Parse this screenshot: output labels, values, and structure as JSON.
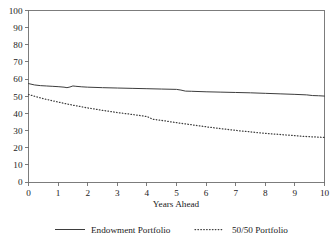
{
  "chart_data": {
    "type": "line",
    "title": "",
    "xlabel": "Years Ahead",
    "ylabel": "",
    "xlim": [
      0,
      10
    ],
    "ylim": [
      0,
      100
    ],
    "grid": false,
    "legend_position": "bottom",
    "xticks": [
      "0",
      "1",
      "2",
      "3",
      "4",
      "5",
      "6",
      "7",
      "8",
      "9",
      "10"
    ],
    "yticks": [
      "0",
      "10",
      "20",
      "30",
      "40",
      "50",
      "60",
      "70",
      "80",
      "90",
      "100"
    ],
    "series": [
      {
        "name": "Endowment Portfolio",
        "style": "solid",
        "color": "#3d3d3d",
        "x": [
          0.0,
          0.2,
          0.4,
          0.6,
          0.8,
          1.0,
          1.2,
          1.3,
          1.4,
          1.5,
          1.6,
          1.8,
          2.0,
          2.5,
          3.0,
          3.5,
          4.0,
          4.5,
          5.0,
          5.15,
          5.3,
          5.5,
          6.0,
          6.5,
          7.0,
          7.5,
          8.0,
          8.5,
          9.0,
          9.4,
          9.6,
          9.8,
          10.0
        ],
        "y": [
          57.4,
          56.6,
          56.2,
          56.0,
          55.8,
          55.6,
          55.3,
          55.0,
          55.4,
          56.0,
          55.8,
          55.5,
          55.3,
          55.0,
          54.8,
          54.6,
          54.4,
          54.2,
          54.0,
          53.6,
          53.0,
          52.9,
          52.6,
          52.4,
          52.2,
          52.0,
          51.7,
          51.4,
          51.1,
          50.8,
          50.4,
          50.3,
          50.1
        ]
      },
      {
        "name": "50/50 Portfolio",
        "style": "dotted",
        "color": "#3d3d3d",
        "x": [
          0.0,
          0.5,
          1.0,
          1.5,
          2.0,
          2.5,
          3.0,
          3.5,
          4.0,
          4.2,
          4.5,
          5.0,
          5.5,
          6.0,
          6.5,
          7.0,
          7.5,
          8.0,
          8.5,
          9.0,
          9.5,
          10.0
        ],
        "y": [
          51.0,
          48.6,
          46.6,
          44.8,
          43.2,
          41.8,
          40.5,
          39.4,
          38.2,
          36.6,
          35.9,
          34.6,
          33.4,
          32.2,
          31.1,
          30.1,
          29.2,
          28.4,
          27.7,
          27.0,
          26.4,
          26.0
        ]
      }
    ]
  },
  "legend": {
    "entries": [
      {
        "label": "Endowment Portfolio"
      },
      {
        "label": "50/50 Portfolio"
      }
    ]
  },
  "axes": {
    "x_title": "Years Ahead"
  }
}
